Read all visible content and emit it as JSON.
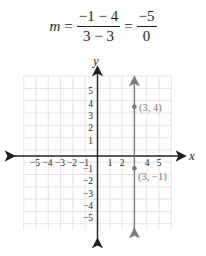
{
  "equation": {
    "lhs": "m",
    "eq1": "=",
    "frac1_num": "−1 − 4",
    "frac1_den": "3 − 3",
    "eq2": "=",
    "frac2_num": "−5",
    "frac2_den": "0"
  },
  "graph": {
    "x_axis_label": "x",
    "y_axis_label": "y",
    "x_ticks": [
      "−5",
      "−4",
      "−3",
      "−2",
      "−1",
      "1",
      "2",
      "4",
      "5"
    ],
    "y_ticks_pos": [
      "5",
      "4",
      "3",
      "2",
      "1"
    ],
    "y_ticks_neg": [
      "−1",
      "−2",
      "−3",
      "−4",
      "−5"
    ],
    "points": [
      {
        "label": "(3, 4)",
        "x": 3,
        "y": 4
      },
      {
        "label": "(3, −1)",
        "x": 3,
        "y": -1
      }
    ],
    "line": {
      "type": "vertical",
      "x": 3
    },
    "colors": {
      "grid": "#d9d9d9",
      "axis": "#231f20",
      "line": "#7a7a7a"
    }
  }
}
